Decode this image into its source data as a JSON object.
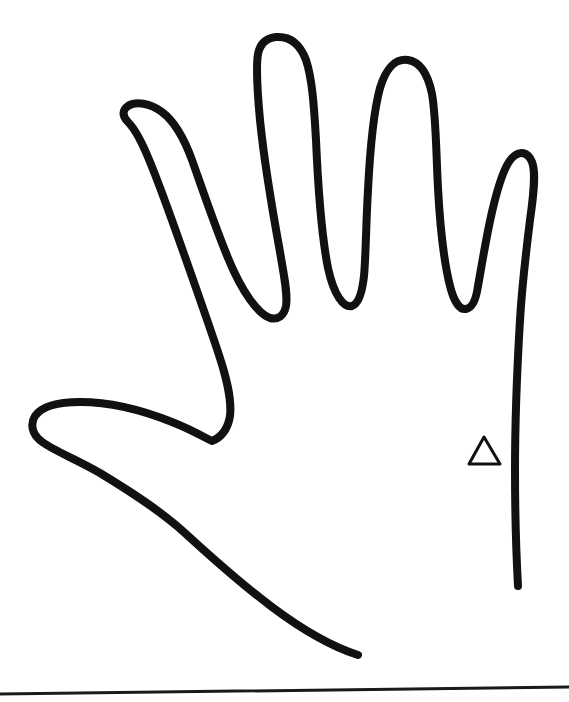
{
  "image": {
    "kind": "scanned-line-drawing",
    "title": "Hand outline tracing",
    "subject": "traced human hand, fingers spread, thumb to the left",
    "background_color": "#ffffff",
    "ink_color": "#111111",
    "width": 569,
    "height": 702
  },
  "drawing": {
    "hand_outline": {
      "name": "hand-outline",
      "stroke_color": "#111111",
      "stroke_width": 8,
      "description": "open left hand traced with a marker; outline is an open path with two free ends near the wrist"
    },
    "marker_triangle": {
      "name": "triangle-marker",
      "stroke_color": "#111111",
      "stroke_width": 3,
      "fill": "none",
      "apex_x": 484,
      "apex_y": 437,
      "base_left_x": 469,
      "base_right_x": 500,
      "base_y": 464,
      "description": "small hollow triangle drawn on the palm near the outer edge"
    },
    "baseline_rule": {
      "name": "baseline-rule",
      "stroke_color": "#1a1a1a",
      "stroke_width": 3,
      "left_x": 0,
      "left_y": 694,
      "right_x": 569,
      "right_y": 687,
      "description": "horizontal ruled line across the bottom of the page, tilted slightly upward to the right"
    }
  },
  "features": {
    "fingertips": [
      {
        "label": "index-fingertip",
        "x": 152,
        "y": 113
      },
      {
        "label": "middle-fingertip",
        "x": 284,
        "y": 38
      },
      {
        "label": "ring-fingertip",
        "x": 380,
        "y": 56
      },
      {
        "label": "pinky-fingertip",
        "x": 503,
        "y": 153
      },
      {
        "label": "thumb-tip",
        "x": 36,
        "y": 425
      }
    ],
    "valleys": [
      {
        "label": "index-middle-valley",
        "x": 285,
        "y": 312
      },
      {
        "label": "middle-ring-valley",
        "x": 356,
        "y": 284
      },
      {
        "label": "ring-pinky-valley",
        "x": 443,
        "y": 318
      },
      {
        "label": "thumb-index-web",
        "x": 212,
        "y": 441
      }
    ],
    "open_ends": [
      {
        "label": "wrist-end-left",
        "x": 358,
        "y": 655
      },
      {
        "label": "wrist-end-right",
        "x": 518,
        "y": 586
      }
    ]
  }
}
